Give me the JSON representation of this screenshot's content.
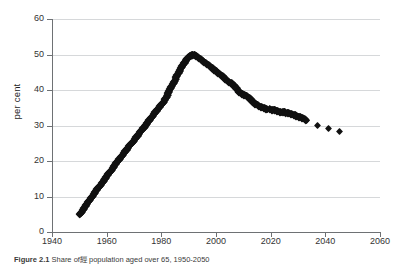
{
  "figure": {
    "caption_label": "Figure 2.1",
    "caption_text": "Share of經 population aged over 65, 1950-2050"
  },
  "chart_data": {
    "type": "scatter",
    "title": "",
    "xlabel": "",
    "ylabel": "per cent",
    "xlim": [
      1940,
      2060
    ],
    "ylim": [
      0,
      60
    ],
    "xticks": [
      1940,
      1960,
      1980,
      2000,
      2020,
      2040,
      2060
    ],
    "yticks": [
      0,
      10,
      20,
      30,
      40,
      50,
      60
    ],
    "grid": "horizontal",
    "legend": "none",
    "marker": "diamond",
    "marker_color": "#111111",
    "grid_color": "#d6d8da",
    "axis_color": "#6e7174",
    "series": [
      {
        "name": "per cent",
        "x": [
          1950,
          1951,
          1952,
          1953,
          1954,
          1955,
          1956,
          1957,
          1958,
          1959,
          1960,
          1961,
          1962,
          1963,
          1964,
          1965,
          1966,
          1967,
          1968,
          1969,
          1970,
          1971,
          1972,
          1973,
          1974,
          1975,
          1976,
          1977,
          1978,
          1979,
          1980,
          1981,
          1982,
          1983,
          1984,
          1985,
          1986,
          1987,
          1988,
          1989,
          1990,
          1991,
          1992,
          1993,
          1994,
          1995,
          1996,
          1997,
          1998,
          1999,
          2000,
          2001,
          2002,
          2003,
          2004,
          2005,
          2006,
          2007,
          2008,
          2009,
          2010,
          2011,
          2012,
          2013,
          2014,
          2015,
          2016,
          2017,
          2018,
          2019,
          2020,
          2021,
          2022,
          2023,
          2024,
          2025,
          2026,
          2027,
          2028,
          2029,
          2030,
          2031,
          2032,
          2033,
          2037,
          2041,
          2045
        ],
        "y": [
          5.0,
          6.1,
          7.2,
          8.3,
          9.4,
          10.5,
          11.6,
          12.6,
          13.7,
          14.7,
          15.8,
          16.8,
          17.9,
          18.9,
          20.0,
          21.0,
          22.0,
          23.0,
          24.0,
          25.0,
          26.0,
          27.0,
          28.0,
          29.0,
          30.0,
          31.0,
          32.0,
          33.0,
          34.0,
          35.0,
          36.0,
          37.0,
          38.5,
          40.0,
          41.5,
          43.0,
          44.5,
          46.0,
          47.3,
          48.5,
          49.4,
          49.9,
          50.0,
          49.6,
          49.0,
          48.4,
          47.8,
          47.2,
          46.6,
          46.0,
          45.4,
          44.8,
          44.2,
          43.5,
          42.8,
          42.2,
          41.8,
          41.0,
          40.0,
          39.2,
          38.8,
          38.4,
          38.0,
          37.2,
          36.4,
          36.0,
          35.3,
          35.2,
          34.8,
          34.6,
          34.6,
          34.4,
          34.3,
          34.0,
          33.8,
          33.9,
          33.6,
          33.4,
          33.2,
          33.0,
          32.6,
          32.4,
          32.0,
          31.4,
          30.0,
          29.2,
          28.2
        ]
      }
    ]
  }
}
